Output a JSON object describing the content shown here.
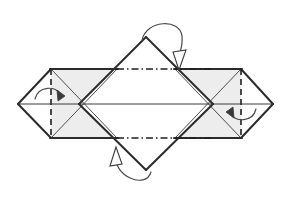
{
  "figure": {
    "title": "Origami crease pattern fold step",
    "kind": "origami-folding-diagram",
    "canvas": {
      "width": 291,
      "height": 203
    },
    "background_color": "#ffffff"
  },
  "palette": {
    "paper_shaded": "#ededed",
    "paper_white": "#ffffff",
    "edge_stroke": "#2b2b2b",
    "thin_stroke": "#3a3a3a",
    "fold_stroke": "#1f1f1f",
    "arrow_stroke": "#4a4a4a"
  },
  "geometry": {
    "center_y": 104,
    "left_tip_x": 18,
    "right_tip_x": 273,
    "top_band_y": 69,
    "bottom_band_y": 138,
    "left_square_left_x": 51,
    "left_square_right_x": 117,
    "right_square_left_x": 175,
    "right_square_right_x": 241,
    "center_diamond_top": {
      "x": 146,
      "y": 37
    },
    "center_diamond_bottom": {
      "x": 146,
      "y": 170
    },
    "left_cross_x": 84,
    "right_cross_x": 209
  },
  "shapes": {
    "left_shaded_square": {
      "name": "left-shaded-square",
      "points": "51,69 117,69 117,138 51,138",
      "fill": "#ededed"
    },
    "right_shaded_square": {
      "name": "right-shaded-square",
      "points": "175,69 241,69 241,138 175,138",
      "fill": "#ededed"
    },
    "center_diamond": {
      "name": "center-diamond",
      "points": "146,37 213,104 146,170 79,104",
      "fill": "#ffffff"
    },
    "left_point_triangle": {
      "name": "left-point-triangle",
      "points": "51,69 51,138 18,104",
      "fill": "#ffffff"
    },
    "right_point_triangle": {
      "name": "right-point-triangle",
      "points": "241,69 241,138 273,104",
      "fill": "#ffffff"
    }
  },
  "edges": {
    "outline_top_left": "51,69 117,69",
    "outline_top_right": "175,69 241,69",
    "outline_bottom_left": "51,138 117,138",
    "outline_bottom_right": "175,138 241,138",
    "left_upper_slant": "18,104 51,69",
    "left_lower_slant": "18,104 51,138",
    "right_upper_slant": "273,104 241,69",
    "right_lower_slant": "273,104 241,138",
    "diamond_upper_left": "79,104 146,37",
    "diamond_upper_right": "146,37 213,104",
    "diamond_lower_left": "79,104 146,170",
    "diamond_lower_right": "146,170 213,104",
    "left_square_diag_down": "51,69 117,138",
    "left_square_diag_up": "51,138 117,69",
    "right_square_diag_down": "175,69 241,138",
    "right_square_diag_up": "175,138 241,69",
    "horizontal_center": "18,104 273,104"
  },
  "fold_lines": {
    "mountain_top": {
      "label": "mountain-fold-top",
      "from": "117,69",
      "to": "210,69",
      "style": "dash-dot"
    },
    "mountain_bottom": {
      "label": "mountain-fold-bottom",
      "from": "117,138",
      "to": "210,138",
      "style": "dash-dot"
    },
    "valley_left": {
      "label": "valley-fold-left",
      "from": "51,69",
      "to": "51,138",
      "style": "dashed"
    },
    "valley_right": {
      "label": "valley-fold-right",
      "from": "241,69",
      "to": "241,138",
      "style": "dashed"
    }
  },
  "arrows": {
    "top": {
      "label": "fold-behind-arrow-top",
      "direction": "down",
      "head_style": "hollow",
      "description": "Curved arrow over top apex folding the upper diamond point behind"
    },
    "bottom": {
      "label": "fold-behind-arrow-bottom",
      "direction": "up",
      "head_style": "hollow",
      "description": "Curved arrow under bottom apex folding the lower diamond point behind"
    },
    "left": {
      "label": "fold-arrow-left",
      "direction": "right",
      "head_style": "solid",
      "description": "Small arc arrow folding the left point inward to the dashed crease"
    },
    "right": {
      "label": "fold-arrow-right",
      "direction": "left",
      "head_style": "solid",
      "description": "Small arc arrow folding the right point inward to the dashed crease"
    }
  }
}
